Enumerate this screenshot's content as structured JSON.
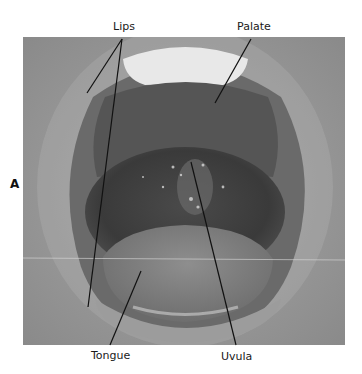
{
  "figure": {
    "panel_letter": "A",
    "labels": {
      "lips": "Lips",
      "palate": "Palate",
      "tongue": "Tongue",
      "uvula": "Uvula"
    },
    "colors": {
      "background": "#ffffff",
      "leader_line": "#111111"
    }
  }
}
